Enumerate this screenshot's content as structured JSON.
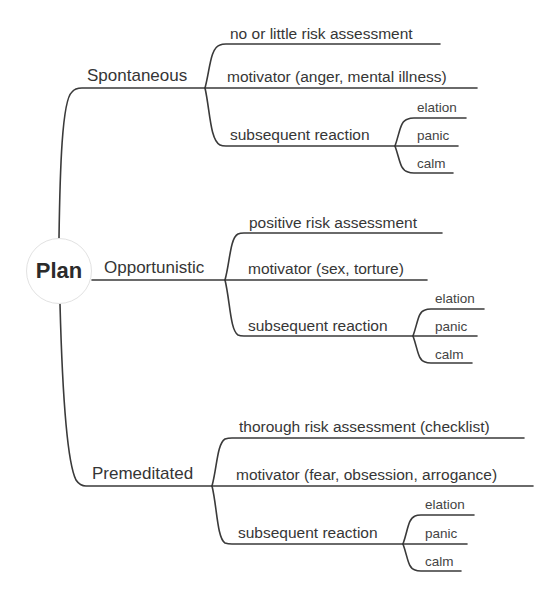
{
  "root": {
    "label": "Plan"
  },
  "branches": [
    {
      "label": "Spontaneous",
      "children": [
        {
          "label": "no or little risk assessment"
        },
        {
          "label": "motivator (anger, mental illness)"
        },
        {
          "label": "subsequent reaction",
          "children": [
            {
              "label": "elation"
            },
            {
              "label": "panic"
            },
            {
              "label": "calm"
            }
          ]
        }
      ]
    },
    {
      "label": "Opportunistic",
      "children": [
        {
          "label": "positive risk assessment"
        },
        {
          "label": "motivator (sex, torture)"
        },
        {
          "label": "subsequent reaction",
          "children": [
            {
              "label": "elation"
            },
            {
              "label": "panic"
            },
            {
              "label": "calm"
            }
          ]
        }
      ]
    },
    {
      "label": "Premeditated",
      "children": [
        {
          "label": "thorough risk assessment (checklist)"
        },
        {
          "label": "motivator (fear, obsession, arrogance)"
        },
        {
          "label": "subsequent reaction",
          "children": [
            {
              "label": "elation"
            },
            {
              "label": "panic"
            },
            {
              "label": "calm"
            }
          ]
        }
      ]
    }
  ],
  "colors": {
    "line": "#3a3a3a",
    "text": "#333333",
    "root_border": "#e2e2e2",
    "background": "#ffffff"
  }
}
